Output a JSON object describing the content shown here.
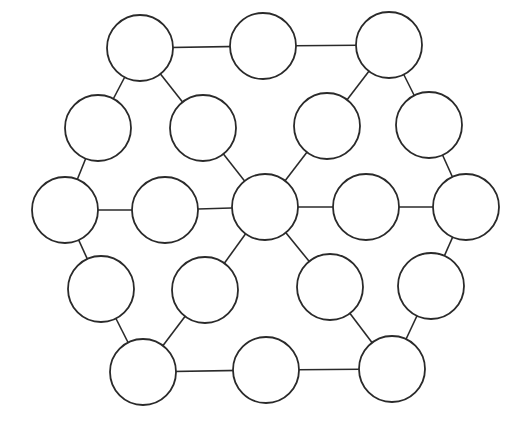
{
  "diagram": {
    "type": "graph",
    "style": {
      "stroke_color": "#2a2a2a",
      "fill_color": "#ffffff",
      "background": "#ffffff",
      "node_radius": 33
    },
    "nodes": [
      {
        "id": "n1",
        "x": 140,
        "y": 48,
        "label": ""
      },
      {
        "id": "n2",
        "x": 263,
        "y": 46,
        "label": ""
      },
      {
        "id": "n3",
        "x": 389,
        "y": 45,
        "label": ""
      },
      {
        "id": "n4",
        "x": 98,
        "y": 128,
        "label": ""
      },
      {
        "id": "n5",
        "x": 203,
        "y": 128,
        "label": ""
      },
      {
        "id": "n6",
        "x": 327,
        "y": 126,
        "label": ""
      },
      {
        "id": "n7",
        "x": 429,
        "y": 125,
        "label": ""
      },
      {
        "id": "n8",
        "x": 65,
        "y": 210,
        "label": ""
      },
      {
        "id": "n9",
        "x": 165,
        "y": 210,
        "label": ""
      },
      {
        "id": "n10",
        "x": 265,
        "y": 207,
        "label": ""
      },
      {
        "id": "n11",
        "x": 366,
        "y": 207,
        "label": ""
      },
      {
        "id": "n12",
        "x": 466,
        "y": 207,
        "label": ""
      },
      {
        "id": "n13",
        "x": 101,
        "y": 289,
        "label": ""
      },
      {
        "id": "n14",
        "x": 205,
        "y": 290,
        "label": ""
      },
      {
        "id": "n15",
        "x": 330,
        "y": 287,
        "label": ""
      },
      {
        "id": "n16",
        "x": 431,
        "y": 286,
        "label": ""
      },
      {
        "id": "n17",
        "x": 143,
        "y": 372,
        "label": ""
      },
      {
        "id": "n18",
        "x": 266,
        "y": 370,
        "label": ""
      },
      {
        "id": "n19",
        "x": 392,
        "y": 369,
        "label": ""
      }
    ],
    "edges": [
      [
        "n1",
        "n2"
      ],
      [
        "n2",
        "n3"
      ],
      [
        "n1",
        "n4"
      ],
      [
        "n1",
        "n5"
      ],
      [
        "n3",
        "n6"
      ],
      [
        "n3",
        "n7"
      ],
      [
        "n4",
        "n8"
      ],
      [
        "n5",
        "n10"
      ],
      [
        "n6",
        "n10"
      ],
      [
        "n7",
        "n12"
      ],
      [
        "n8",
        "n9"
      ],
      [
        "n9",
        "n10"
      ],
      [
        "n10",
        "n11"
      ],
      [
        "n11",
        "n12"
      ],
      [
        "n8",
        "n13"
      ],
      [
        "n10",
        "n14"
      ],
      [
        "n10",
        "n15"
      ],
      [
        "n12",
        "n16"
      ],
      [
        "n13",
        "n17"
      ],
      [
        "n14",
        "n17"
      ],
      [
        "n15",
        "n19"
      ],
      [
        "n16",
        "n19"
      ],
      [
        "n17",
        "n18"
      ],
      [
        "n18",
        "n19"
      ]
    ]
  }
}
